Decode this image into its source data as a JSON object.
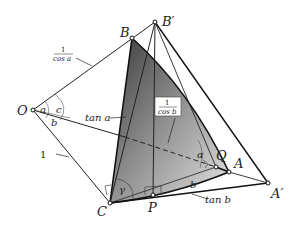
{
  "figure": {
    "points": {
      "O": "O",
      "B": "B",
      "B_prime": "B′",
      "C": "C",
      "P": "P",
      "Q": "Q",
      "A": "A",
      "A_prime": "A′"
    },
    "angles": {
      "a": "a",
      "b": "b",
      "c": "c",
      "gamma": "γ",
      "alpha": "α",
      "b_at_A": "b"
    },
    "lengths": {
      "one": "1",
      "tan_a": "tan a",
      "tan_b": "tan b",
      "sec_a_num": "1",
      "sec_a_den": "cos a",
      "sec_b_num": "1",
      "sec_b_den": "cos b"
    }
  }
}
